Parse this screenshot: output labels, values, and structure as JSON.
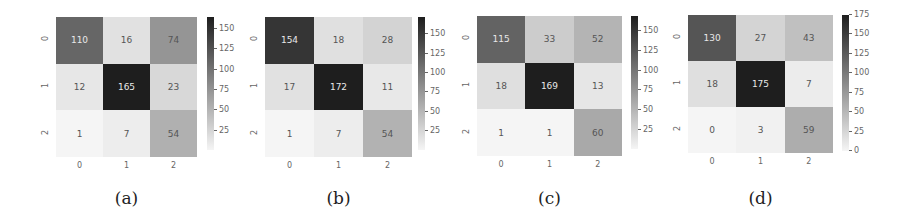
{
  "chart_data": [
    {
      "type": "heatmap",
      "title": "",
      "caption": "(a)",
      "x_ticks": [
        "0",
        "1",
        "2"
      ],
      "y_ticks": [
        "0",
        "1",
        "2"
      ],
      "matrix": [
        [
          110,
          16,
          74
        ],
        [
          12,
          165,
          23
        ],
        [
          1,
          7,
          54
        ]
      ],
      "colorbar": {
        "ticks": [
          25,
          50,
          75,
          100,
          125,
          150
        ],
        "vmin": 1,
        "vmax": 165,
        "cmap": "Greys"
      }
    },
    {
      "type": "heatmap",
      "title": "",
      "caption": "(b)",
      "x_ticks": [
        "0",
        "1",
        "2"
      ],
      "y_ticks": [
        "0",
        "1",
        "2"
      ],
      "matrix": [
        [
          154,
          18,
          28
        ],
        [
          17,
          172,
          11
        ],
        [
          1,
          7,
          54
        ]
      ],
      "colorbar": {
        "ticks": [
          25,
          50,
          75,
          100,
          125,
          150
        ],
        "vmin": 1,
        "vmax": 172,
        "cmap": "Greys"
      }
    },
    {
      "type": "heatmap",
      "title": "",
      "caption": "(c)",
      "x_ticks": [
        "0",
        "1",
        "2"
      ],
      "y_ticks": [
        "0",
        "1",
        "2"
      ],
      "matrix": [
        [
          115,
          33,
          52
        ],
        [
          18,
          169,
          13
        ],
        [
          1,
          1,
          60
        ]
      ],
      "colorbar": {
        "ticks": [
          25,
          50,
          75,
          100,
          125,
          150
        ],
        "vmin": 1,
        "vmax": 169,
        "cmap": "Greys"
      }
    },
    {
      "type": "heatmap",
      "title": "",
      "caption": "(d)",
      "x_ticks": [
        "0",
        "1",
        "2"
      ],
      "y_ticks": [
        "0",
        "1",
        "2"
      ],
      "matrix": [
        [
          130,
          27,
          43
        ],
        [
          18,
          175,
          7
        ],
        [
          0,
          3,
          59
        ]
      ],
      "colorbar": {
        "ticks": [
          0,
          25,
          50,
          75,
          100,
          125,
          150,
          175
        ],
        "vmin": 0,
        "vmax": 175,
        "cmap": "Greys"
      }
    }
  ],
  "layout": {
    "panels": [
      {
        "gx": 56,
        "gy": 17,
        "gw": 141,
        "gh": 140,
        "cbx": 207,
        "cby": 17,
        "cbh": 133
      },
      {
        "gx": 265,
        "gy": 17,
        "gw": 147,
        "gh": 140,
        "cbx": 418,
        "cby": 17,
        "cbh": 133
      },
      {
        "gx": 477,
        "gy": 16,
        "gw": 145,
        "gh": 140,
        "cbx": 631,
        "cby": 16,
        "cbh": 133
      },
      {
        "gx": 688,
        "gy": 15,
        "gw": 145,
        "gh": 138,
        "cbx": 842,
        "cby": 15,
        "cbh": 136
      }
    ]
  }
}
